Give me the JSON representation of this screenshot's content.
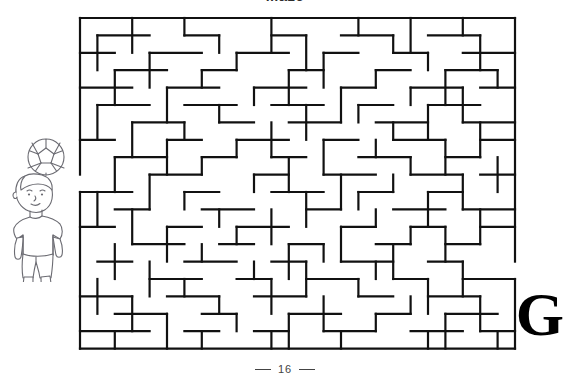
{
  "page": {
    "background_color": "#ffffff",
    "heading_clipped": "Maze",
    "footer": {
      "page_number": "16",
      "left_dash": "—",
      "right_dash": "—"
    },
    "corner_letter": "G"
  },
  "illustration": {
    "name": "boy-heading-soccer-ball",
    "description": "Line drawing of a boy heading a soccer ball",
    "stroke_color": "#6b6b72",
    "fill_color": "#ffffff",
    "parts": [
      "soccer-ball",
      "head",
      "hair",
      "face",
      "torso-shirt",
      "arms",
      "shorts",
      "legs",
      "shoes"
    ]
  },
  "maze": {
    "name": "rectangular-grid-maze",
    "stroke_color": "#111111",
    "background_color": "#ffffff",
    "cell_size": 17.4,
    "wall_thickness": 2.2,
    "cols": 25,
    "rows": 19,
    "origin_x": 2,
    "origin_y": 2,
    "entrance": {
      "side": "left",
      "cell_row": 9
    },
    "exit": {
      "side": "right",
      "cell_row": 14
    },
    "border": {
      "top": true,
      "right": true,
      "bottom": true,
      "left": true
    },
    "h_walls": [
      [
        3,
        0,
        6
      ],
      [
        8,
        0,
        11
      ],
      [
        13,
        0,
        16
      ],
      [
        19,
        0,
        22
      ],
      [
        1,
        1,
        4
      ],
      [
        6,
        1,
        8
      ],
      [
        11,
        1,
        13
      ],
      [
        15,
        1,
        18
      ],
      [
        20,
        1,
        23
      ],
      [
        0,
        2,
        2
      ],
      [
        4,
        2,
        7
      ],
      [
        9,
        2,
        12
      ],
      [
        14,
        2,
        16
      ],
      [
        18,
        2,
        20
      ],
      [
        22,
        2,
        25
      ],
      [
        2,
        3,
        5
      ],
      [
        7,
        3,
        9
      ],
      [
        12,
        3,
        14
      ],
      [
        17,
        3,
        19
      ],
      [
        21,
        3,
        24
      ],
      [
        0,
        4,
        3
      ],
      [
        5,
        4,
        8
      ],
      [
        10,
        4,
        13
      ],
      [
        15,
        4,
        17
      ],
      [
        19,
        4,
        22
      ],
      [
        23,
        4,
        25
      ],
      [
        1,
        5,
        4
      ],
      [
        6,
        5,
        9
      ],
      [
        11,
        5,
        14
      ],
      [
        16,
        5,
        18
      ],
      [
        20,
        5,
        23
      ],
      [
        3,
        6,
        6
      ],
      [
        8,
        6,
        10
      ],
      [
        12,
        6,
        15
      ],
      [
        17,
        6,
        20
      ],
      [
        22,
        6,
        25
      ],
      [
        0,
        7,
        2
      ],
      [
        5,
        7,
        7
      ],
      [
        9,
        7,
        12
      ],
      [
        14,
        7,
        16
      ],
      [
        18,
        7,
        21
      ],
      [
        23,
        7,
        25
      ],
      [
        2,
        8,
        5
      ],
      [
        7,
        8,
        9
      ],
      [
        11,
        8,
        13
      ],
      [
        16,
        8,
        19
      ],
      [
        21,
        8,
        23
      ],
      [
        4,
        9,
        7
      ],
      [
        10,
        9,
        12
      ],
      [
        14,
        9,
        17
      ],
      [
        19,
        9,
        22
      ],
      [
        23,
        9,
        25
      ],
      [
        0,
        10,
        3
      ],
      [
        6,
        10,
        8
      ],
      [
        11,
        10,
        14
      ],
      [
        16,
        10,
        18
      ],
      [
        20,
        10,
        22
      ],
      [
        2,
        11,
        4
      ],
      [
        7,
        11,
        10
      ],
      [
        13,
        11,
        15
      ],
      [
        18,
        11,
        21
      ],
      [
        22,
        11,
        25
      ],
      [
        0,
        12,
        2
      ],
      [
        5,
        12,
        7
      ],
      [
        9,
        12,
        12
      ],
      [
        15,
        12,
        17
      ],
      [
        19,
        12,
        21
      ],
      [
        23,
        12,
        25
      ],
      [
        3,
        13,
        6
      ],
      [
        8,
        13,
        10
      ],
      [
        12,
        13,
        14
      ],
      [
        17,
        13,
        19
      ],
      [
        21,
        13,
        23
      ],
      [
        1,
        14,
        3
      ],
      [
        6,
        14,
        9
      ],
      [
        11,
        14,
        13
      ],
      [
        15,
        14,
        18
      ],
      [
        20,
        14,
        22
      ],
      [
        4,
        15,
        7
      ],
      [
        9,
        15,
        11
      ],
      [
        13,
        15,
        16
      ],
      [
        18,
        15,
        20
      ],
      [
        22,
        15,
        25
      ],
      [
        0,
        16,
        3
      ],
      [
        5,
        16,
        8
      ],
      [
        10,
        16,
        13
      ],
      [
        16,
        16,
        18
      ],
      [
        20,
        16,
        23
      ],
      [
        2,
        17,
        5
      ],
      [
        7,
        17,
        9
      ],
      [
        12,
        17,
        15
      ],
      [
        17,
        17,
        19
      ],
      [
        21,
        17,
        24
      ],
      [
        0,
        18,
        4
      ],
      [
        6,
        18,
        8
      ],
      [
        10,
        18,
        12
      ],
      [
        14,
        18,
        17
      ],
      [
        19,
        18,
        22
      ],
      [
        23,
        18,
        25
      ]
    ],
    "v_walls": [
      [
        3,
        0,
        2
      ],
      [
        6,
        0,
        1
      ],
      [
        11,
        0,
        2
      ],
      [
        16,
        0,
        1
      ],
      [
        19,
        0,
        2
      ],
      [
        22,
        0,
        1
      ],
      [
        1,
        1,
        3
      ],
      [
        8,
        1,
        2
      ],
      [
        13,
        1,
        3
      ],
      [
        18,
        1,
        2
      ],
      [
        23,
        1,
        3
      ],
      [
        4,
        2,
        4
      ],
      [
        9,
        2,
        3
      ],
      [
        14,
        2,
        4
      ],
      [
        20,
        2,
        3
      ],
      [
        2,
        3,
        5
      ],
      [
        7,
        3,
        4
      ],
      [
        12,
        3,
        5
      ],
      [
        17,
        3,
        4
      ],
      [
        21,
        3,
        5
      ],
      [
        24,
        3,
        4
      ],
      [
        5,
        4,
        6
      ],
      [
        10,
        4,
        5
      ],
      [
        15,
        4,
        6
      ],
      [
        19,
        4,
        5
      ],
      [
        22,
        4,
        6
      ],
      [
        1,
        5,
        7
      ],
      [
        8,
        5,
        6
      ],
      [
        13,
        5,
        7
      ],
      [
        16,
        5,
        6
      ],
      [
        20,
        5,
        7
      ],
      [
        3,
        6,
        8
      ],
      [
        6,
        6,
        7
      ],
      [
        11,
        6,
        8
      ],
      [
        18,
        6,
        7
      ],
      [
        23,
        6,
        8
      ],
      [
        5,
        7,
        9
      ],
      [
        9,
        7,
        8
      ],
      [
        14,
        7,
        9
      ],
      [
        17,
        7,
        8
      ],
      [
        21,
        7,
        9
      ],
      [
        2,
        8,
        10
      ],
      [
        7,
        8,
        9
      ],
      [
        12,
        8,
        10
      ],
      [
        19,
        8,
        9
      ],
      [
        24,
        8,
        10
      ],
      [
        4,
        9,
        11
      ],
      [
        10,
        9,
        10
      ],
      [
        15,
        9,
        11
      ],
      [
        18,
        9,
        10
      ],
      [
        22,
        9,
        11
      ],
      [
        1,
        10,
        12
      ],
      [
        6,
        10,
        11
      ],
      [
        13,
        10,
        12
      ],
      [
        16,
        10,
        11
      ],
      [
        20,
        10,
        12
      ],
      [
        3,
        11,
        13
      ],
      [
        8,
        11,
        12
      ],
      [
        11,
        11,
        13
      ],
      [
        17,
        11,
        12
      ],
      [
        23,
        11,
        13
      ],
      [
        5,
        12,
        14
      ],
      [
        9,
        12,
        13
      ],
      [
        15,
        12,
        14
      ],
      [
        19,
        12,
        13
      ],
      [
        21,
        12,
        14
      ],
      [
        2,
        13,
        15
      ],
      [
        7,
        13,
        14
      ],
      [
        12,
        13,
        15
      ],
      [
        14,
        13,
        14
      ],
      [
        18,
        13,
        15
      ],
      [
        4,
        14,
        16
      ],
      [
        10,
        14,
        15
      ],
      [
        13,
        14,
        16
      ],
      [
        17,
        14,
        15
      ],
      [
        22,
        14,
        16
      ],
      [
        1,
        15,
        17
      ],
      [
        6,
        15,
        16
      ],
      [
        11,
        15,
        17
      ],
      [
        16,
        15,
        16
      ],
      [
        20,
        15,
        17
      ],
      [
        3,
        16,
        18
      ],
      [
        8,
        16,
        17
      ],
      [
        14,
        16,
        18
      ],
      [
        19,
        16,
        17
      ],
      [
        23,
        16,
        18
      ],
      [
        5,
        17,
        19
      ],
      [
        9,
        17,
        18
      ],
      [
        12,
        17,
        19
      ],
      [
        17,
        17,
        18
      ],
      [
        21,
        17,
        19
      ],
      [
        2,
        18,
        19
      ],
      [
        7,
        18,
        19
      ],
      [
        11,
        18,
        19
      ],
      [
        15,
        18,
        19
      ],
      [
        20,
        18,
        19
      ],
      [
        24,
        18,
        19
      ]
    ]
  }
}
